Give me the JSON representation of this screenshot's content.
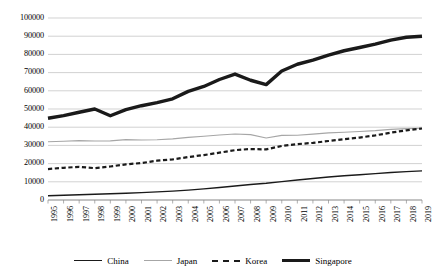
{
  "chart_data": {
    "type": "line",
    "title": "",
    "subtitle": "",
    "xlabel": "",
    "ylabel": "",
    "grid": true,
    "legend_position": "bottom",
    "ylim": [
      0,
      100000
    ],
    "ytick_step": 10000,
    "yticks": [
      "0",
      "10000",
      "20000",
      "30000",
      "40000",
      "50000",
      "60000",
      "70000",
      "80000",
      "90000",
      "100000"
    ],
    "categories": [
      "1995",
      "1996",
      "1997",
      "1998",
      "1999",
      "2000",
      "2001",
      "2002",
      "2003",
      "2004",
      "2005",
      "2006",
      "2007",
      "2008",
      "2009",
      "2010",
      "2011",
      "2012",
      "2013",
      "2014",
      "2015",
      "2016",
      "2017",
      "2018",
      "2019"
    ],
    "series": [
      {
        "name": "China",
        "color": "#1a1a1a",
        "style": "solid-thin",
        "values": [
          2300,
          2600,
          2900,
          3150,
          3400,
          3700,
          4050,
          4450,
          4900,
          5450,
          6100,
          6850,
          7700,
          8500,
          9200,
          10100,
          11000,
          11800,
          12600,
          13300,
          13900,
          14500,
          15100,
          15600,
          16000
        ]
      },
      {
        "name": "Japan",
        "color": "#a6a6a6",
        "style": "solid-thin",
        "values": [
          32000,
          32300,
          32600,
          32400,
          32500,
          33200,
          33000,
          33100,
          33600,
          34400,
          35000,
          35700,
          36300,
          35900,
          34100,
          35500,
          35600,
          36200,
          36900,
          37200,
          37600,
          38100,
          38800,
          39200,
          39400
        ]
      },
      {
        "name": "Korea",
        "color": "#1a1a1a",
        "style": "dashed",
        "values": [
          17000,
          17700,
          18200,
          17500,
          18400,
          19600,
          20300,
          21600,
          22300,
          23600,
          24700,
          26000,
          27400,
          28000,
          27800,
          29700,
          30700,
          31400,
          32400,
          33400,
          34300,
          35500,
          37000,
          38300,
          39300
        ]
      },
      {
        "name": "Singapore",
        "color": "#1a1a1a",
        "style": "solid-thick",
        "values": [
          44900,
          46400,
          48200,
          50000,
          46300,
          49700,
          51800,
          53500,
          55600,
          59700,
          62400,
          66200,
          69200,
          65800,
          63400,
          70900,
          74600,
          76800,
          79600,
          82000,
          83800,
          85600,
          87800,
          89400,
          90000
        ]
      }
    ]
  },
  "legend": {
    "items": [
      {
        "label": "China"
      },
      {
        "label": "Japan"
      },
      {
        "label": "Korea"
      },
      {
        "label": "Singapore"
      }
    ]
  }
}
